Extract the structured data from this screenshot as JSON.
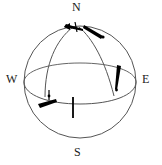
{
  "figure": {
    "colors": {
      "outline": "#555555",
      "equator": "#555555",
      "arc": "#555555",
      "vector": "#000000",
      "label": "#1a1a1a",
      "background": "#ffffff"
    },
    "geometry": {
      "center_x": 80,
      "center_y": 82,
      "radius": 56,
      "equator_ry": 17
    }
  },
  "labels": {
    "north": "N",
    "east": "E",
    "south": "S",
    "west": "W"
  }
}
